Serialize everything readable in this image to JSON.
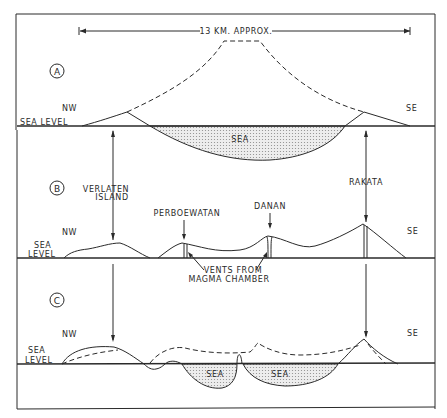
{
  "scale": {
    "label": "13 KM. APPROX."
  },
  "directions": {
    "left": "NW",
    "right": "SE"
  },
  "panels": {
    "a": {
      "id": "A",
      "sea_level": "SEA LEVEL",
      "sea": "SEA"
    },
    "b": {
      "id": "B",
      "sea_level_1": "SEA",
      "sea_level_2": "LEVEL",
      "verlaten_1": "VERLATEN",
      "verlaten_2": "ISLAND",
      "perboewatan": "PERBOEWATAN",
      "danan": "DANAN",
      "rakata": "RAKATA",
      "vents_1": "VENTS  FROM",
      "vents_2": "MAGMA  CHAMBER"
    },
    "c": {
      "id": "C",
      "sea_level_1": "SEA",
      "sea_level_2": "LEVEL",
      "sea_left": "SEA",
      "sea_right": "SEA"
    }
  },
  "colors": {
    "ink": "#2a2a2a",
    "background": "#ffffff",
    "sea_fill": "#d8d8d8"
  }
}
